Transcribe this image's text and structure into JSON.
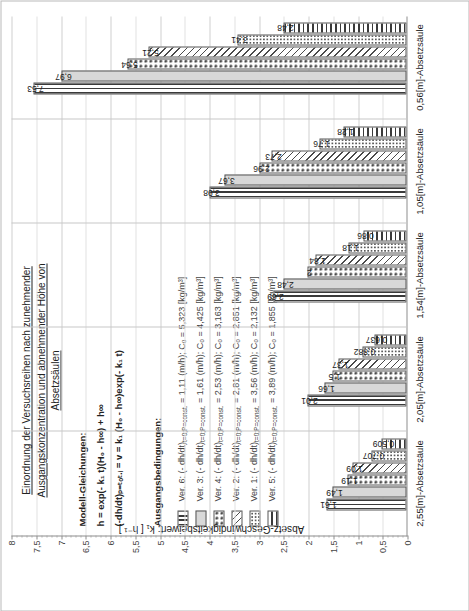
{
  "title": {
    "line1": "Einordnung der Versuchsreihen nach zunehmender",
    "line2": "Ausgangskonzentration und abnehmender Höhe von Absetzsäulen"
  },
  "equations": {
    "header": "Modell-Gleichungen:",
    "eq1": "h = exp(- k₁ t)(H₀ - h∞) + h∞",
    "eq2": "(-dh/dt)ₚ₌ₜₒₜ.ᵢ = v = k₁ (H₀ - h∞)exp(- k₁ t)"
  },
  "conditions_header": "Ausgangsbedingungen:",
  "legend": [
    {
      "pattern": "vline",
      "label": "Ver. 6: (- dh/dt)",
      "sub": "t=0;P=const.",
      "value": " = 1,11 (m/h); C₀ = 5,323 [kg/m³]"
    },
    {
      "pattern": "solid",
      "label": "Ver. 3: (- dh/dt)",
      "sub": "t=0;P=const.",
      "value": " = 1,61 (m/h); C₀ = 4,425 [kg/m³]"
    },
    {
      "pattern": "circ",
      "label": "Ver. 4: (- dh/dt)",
      "sub": "t=0;P=const.",
      "value": " = 2,53 (m/h); C₀ = 3,163 [kg/m³]"
    },
    {
      "pattern": "diag",
      "label": "Ver. 2: (- dh/dt)",
      "sub": "t=0;P=const.",
      "value": " = 2,81 (m/h); C₀ = 2,851 [kg/m³]"
    },
    {
      "pattern": "dotsm",
      "label": "Ver. 1: (- dh/dt)",
      "sub": "t=0;P=const.",
      "value": " = 3,56 (m/h); C₀ = 2,132 [kg/m³]"
    },
    {
      "pattern": "hline",
      "label": "Ver. 5: (- dh/dt)",
      "sub": "t=0;P=const.",
      "value": " = 3,89 (m/h); C₀ = 1,855 [kg/m³]"
    }
  ],
  "chart_data": {
    "type": "bar",
    "title": "Einordnung der Versuchsreihen nach zunehmender Ausgangskonzentration und abnehmender Höhe von Absetzsäulen",
    "xlabel": "",
    "ylabel": "Absetz-Geschwindigkeitsbeiwert: k₁ [ h⁻¹ ]",
    "ylim": [
      0,
      8
    ],
    "yticks": [
      "0",
      "0,5",
      "1",
      "1,5",
      "2",
      "2,5",
      "3",
      "3,5",
      "4",
      "4,5",
      "5",
      "5,5",
      "6",
      "6,5",
      "7",
      "7,5",
      "8"
    ],
    "grid": true,
    "legend_position": "inside-left",
    "categories": [
      "2,55[m]-Absetzsäule",
      "2,05[m]-Absetzsäule",
      "1,54[m]-Absetzsäule",
      "1,05[m]-Absetzsäule",
      "0,56[m]-Absetzsäule"
    ],
    "series": [
      {
        "name": "Ver. 6",
        "pattern": "vline",
        "values": [
          1.61,
          2.01,
          2.69,
          3.98,
          7.53
        ]
      },
      {
        "name": "Ver. 3",
        "pattern": "solid",
        "values": [
          1.49,
          1.66,
          2.48,
          3.67,
          6.97
        ]
      },
      {
        "name": "Ver. 4",
        "pattern": "circ",
        "values": [
          1.19,
          1.5,
          2.0,
          2.96,
          5.64
        ]
      },
      {
        "name": "Ver. 2",
        "pattern": "diag",
        "values": [
          1.09,
          1.37,
          1.84,
          2.73,
          5.21
        ]
      },
      {
        "name": "Ver. 1",
        "pattern": "dotsm",
        "values": [
          0.707,
          0.882,
          1.18,
          1.76,
          3.41
        ]
      },
      {
        "name": "Ver. 5",
        "pattern": "hline",
        "values": [
          0.509,
          0.637,
          0.86,
          1.28,
          2.48
        ]
      }
    ],
    "bar_labels": {
      "2,55[m]-Absetzsäule": [
        "1,61",
        "1,49",
        "1,19",
        "1,09",
        "0,707",
        "0,509"
      ],
      "2,05[m]-Absetzsäule": [
        "2,01",
        "1,66",
        "1,5",
        "1,37",
        "0,882",
        "0,637"
      ],
      "1,54[m]-Absetzsäule": [
        "2,69",
        "2,48",
        "2",
        "1,84",
        "1,18",
        "0,86"
      ],
      "1,05[m]-Absetzsäule": [
        "3,98",
        "3,67",
        "2,96",
        "2,73",
        "1,76",
        "1,28"
      ],
      "0,56[m]-Absetzsäule": [
        "7,53",
        "6,97",
        "5,64",
        "5,21",
        "3,41",
        "2,48"
      ]
    }
  }
}
